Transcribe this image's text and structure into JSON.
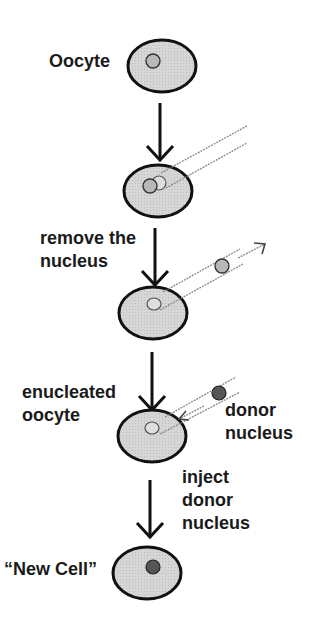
{
  "diagram": {
    "steps": [
      {
        "id": "oocyte",
        "label": "Oocyte"
      },
      {
        "id": "pipette-insert",
        "label": ""
      },
      {
        "id": "remove-nucleus",
        "label_lines": [
          "remove the",
          "nucleus"
        ]
      },
      {
        "id": "enucleated-oocyte",
        "label_lines": [
          "enucleated",
          "oocyte"
        ]
      },
      {
        "id": "donor-nucleus",
        "label_lines": [
          "donor",
          "nucleus"
        ]
      },
      {
        "id": "inject-donor-nucleus",
        "label_lines": [
          "inject",
          "donor",
          "nucleus"
        ]
      },
      {
        "id": "new-cell",
        "label": "“New Cell”"
      }
    ]
  },
  "colors": {
    "cell_fill": "#d4d4d4",
    "cell_stroke": "#111111",
    "nucleus_fill": "#b8b8b8",
    "donor_nucleus_fill": "#555555",
    "text": "#1a1a1a"
  }
}
